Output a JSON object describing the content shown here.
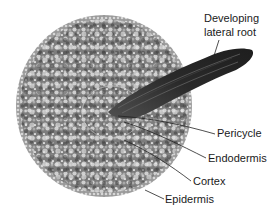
{
  "figure": {
    "labels": {
      "developing_lateral_root_line1": "Developing",
      "developing_lateral_root_line2": "lateral root",
      "pericycle": "Pericycle",
      "endodermis": "Endodermis",
      "cortex": "Cortex",
      "epidermis": "Epidermis"
    },
    "colors": {
      "background": "#ffffff",
      "tissue_base": "#8a8a8a",
      "tissue_dark": "#4a4a4a",
      "cell_light": "#d8d8d8",
      "lateral_root": "#2e2e2e",
      "leader_line": "#222222",
      "text": "#1a1a1a"
    }
  }
}
